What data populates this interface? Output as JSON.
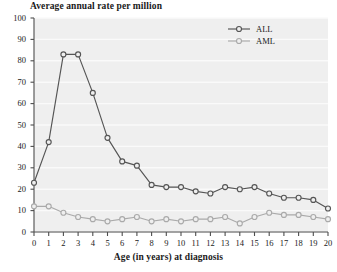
{
  "chart_data": {
    "type": "line",
    "title": "Average annual rate per million",
    "xlabel": "Age (in years) at diagnosis",
    "ylabel": "",
    "x": [
      0,
      1,
      2,
      3,
      4,
      5,
      6,
      7,
      8,
      9,
      10,
      11,
      12,
      13,
      14,
      15,
      16,
      17,
      18,
      19,
      20
    ],
    "xlim": [
      0,
      20
    ],
    "ylim": [
      0,
      100
    ],
    "xticks": [
      "0",
      "1",
      "2",
      "3",
      "4",
      "5",
      "6",
      "7",
      "8",
      "9",
      "10",
      "11",
      "12",
      "13",
      "14",
      "15",
      "16",
      "17",
      "18",
      "19",
      "20"
    ],
    "yticks": [
      "0",
      "10",
      "20",
      "30",
      "40",
      "50",
      "60",
      "70",
      "80",
      "90",
      "100"
    ],
    "grid": true,
    "legend_position": "top-right",
    "series": [
      {
        "name": "ALL",
        "color": "#555555",
        "values": [
          23,
          42,
          83,
          83,
          65,
          44,
          33,
          31,
          22,
          21,
          21,
          19,
          18,
          21,
          20,
          21,
          18,
          16,
          16,
          15,
          11
        ]
      },
      {
        "name": "AML",
        "color": "#aaaaaa",
        "values": [
          12,
          12,
          9,
          7,
          6,
          5,
          6,
          7,
          5,
          6,
          5,
          6,
          6,
          7,
          4,
          7,
          9,
          8,
          8,
          7,
          6
        ]
      }
    ]
  },
  "legend": {
    "entries": [
      {
        "label": "ALL"
      },
      {
        "label": "AML"
      }
    ]
  },
  "colors": {
    "plot_background": "#efefef",
    "gridline": "#fafafa",
    "axis": "#4d4d4d",
    "text": "#1a1a1a",
    "series_all": "#555555",
    "series_aml": "#aaaaaa"
  }
}
